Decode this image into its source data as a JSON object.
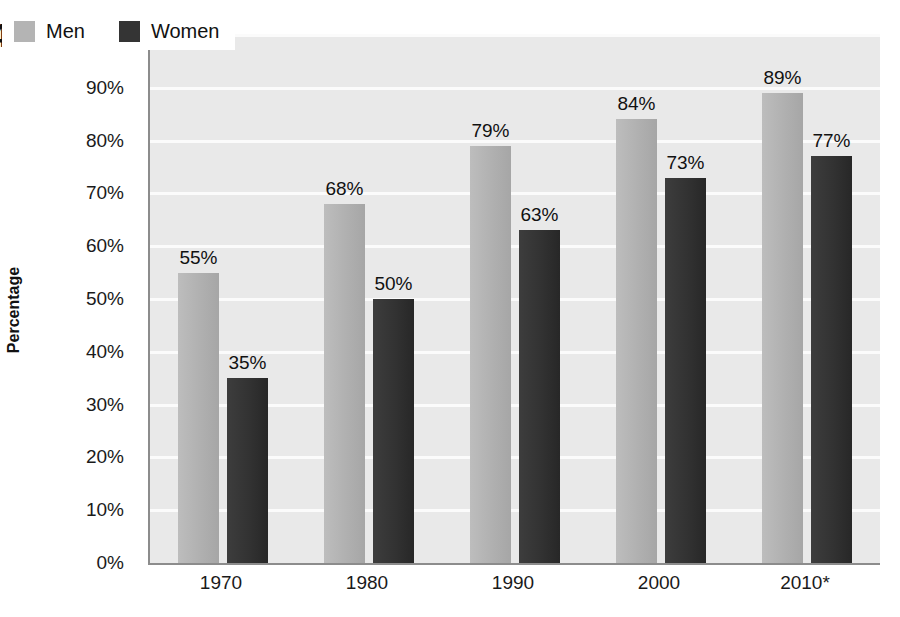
{
  "figure": {
    "number_partial": "4"
  },
  "legend": {
    "position": "top-left-inside",
    "items": [
      {
        "label": "Men",
        "color": "#b4b4b4",
        "swatch": "men-color-swatch"
      },
      {
        "label": "Women",
        "color": "#343434",
        "swatch": "women-color-swatch"
      }
    ]
  },
  "axes": {
    "y_title": "Percentage",
    "y_ticks": [
      "0%",
      "10%",
      "20%",
      "30%",
      "40%",
      "50%",
      "60%",
      "70%",
      "80%",
      "90%",
      "100%"
    ],
    "x_ticks": [
      "1970",
      "1980",
      "1990",
      "2000",
      "2010*"
    ]
  },
  "chart_data": {
    "type": "bar",
    "title": "",
    "subtitle": "",
    "xlabel": "",
    "ylabel": "Percentage",
    "categories": [
      "1970",
      "1980",
      "1990",
      "2000",
      "2010*"
    ],
    "series": [
      {
        "name": "Men",
        "color": "#b4b4b4",
        "values": [
          55,
          68,
          79,
          84,
          89
        ],
        "labels": [
          "55%",
          "68%",
          "79%",
          "84%",
          "89%"
        ]
      },
      {
        "name": "Women",
        "color": "#343434",
        "values": [
          35,
          50,
          63,
          73,
          77
        ],
        "labels": [
          "35%",
          "50%",
          "63%",
          "73%",
          "77%"
        ]
      }
    ],
    "ylim": [
      0,
      100
    ],
    "ytick_values": [
      0,
      10,
      20,
      30,
      40,
      50,
      60,
      70,
      80,
      90,
      100
    ],
    "ytick_suffix": "%",
    "grid": true,
    "grid_color": "#fbfbfb",
    "plot_background": "#e9e9e9",
    "legend_position": "upper left",
    "data_labels": true
  }
}
